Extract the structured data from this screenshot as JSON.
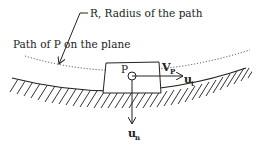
{
  "diagram": {
    "type": "mechanics-free-body",
    "labels": {
      "radius": "R, Radius of the path",
      "path": "Path of P on the plane",
      "point": "P",
      "velocity_main": "V",
      "velocity_sub": "P",
      "tangent_main": "u",
      "tangent_sub": "t",
      "normal_main": "u",
      "normal_sub": "n"
    },
    "colors": {
      "line": "#222222",
      "background": "#ffffff"
    }
  }
}
